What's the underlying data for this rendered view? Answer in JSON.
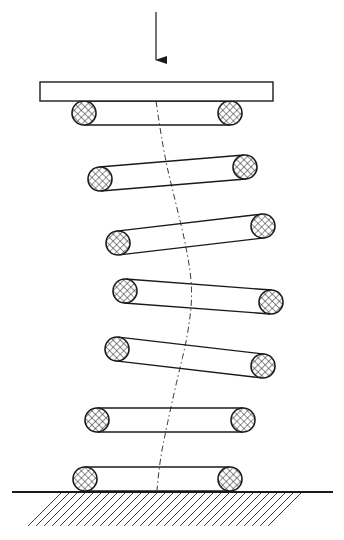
{
  "diagram": {
    "title": "",
    "colors": {
      "stroke": "#1a1a1a",
      "background": "#ffffff",
      "hatch": "#2a2a2a"
    },
    "load_arrow": {
      "x": 156,
      "y1": 12,
      "y2": 60
    },
    "top_plate": {
      "x": 40,
      "y": 82,
      "width": 233,
      "height": 19
    },
    "wire_radius": 12,
    "coils": [
      {
        "left": [
          84,
          113
        ],
        "right": [
          230,
          113
        ]
      },
      {
        "left": [
          100,
          179
        ],
        "right": [
          245,
          167
        ]
      },
      {
        "left": [
          118,
          243
        ],
        "right": [
          263,
          226
        ]
      },
      {
        "left": [
          125,
          291
        ],
        "right": [
          271,
          302
        ]
      },
      {
        "left": [
          117,
          349
        ],
        "right": [
          263,
          366
        ]
      },
      {
        "left": [
          97,
          420
        ],
        "right": [
          243,
          420
        ]
      },
      {
        "left": [
          85,
          479
        ],
        "right": [
          230,
          479
        ]
      }
    ],
    "center_line": [
      [
        156,
        101
      ],
      [
        163,
        150
      ],
      [
        175,
        200
      ],
      [
        186,
        245
      ],
      [
        193,
        290
      ],
      [
        188,
        335
      ],
      [
        177,
        380
      ],
      [
        167,
        425
      ],
      [
        160,
        460
      ],
      [
        157,
        490
      ]
    ],
    "ground": {
      "x1": 12,
      "x2": 333,
      "y": 492,
      "hatch_x1": 28,
      "hatch_x2": 305,
      "hatch_depth": 33,
      "hatch_spacing": 8
    }
  }
}
